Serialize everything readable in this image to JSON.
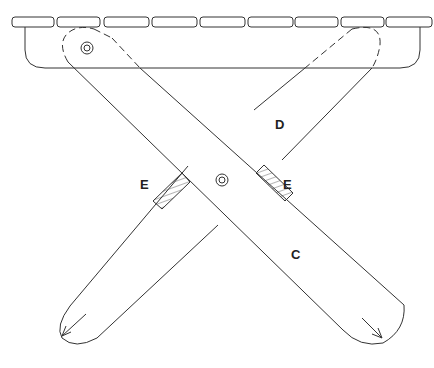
{
  "diagram": {
    "colors": {
      "line": "#333333",
      "background": "#ffffff",
      "hatch": "#444444"
    },
    "labels": {
      "leg_front": "C",
      "leg_back": "D",
      "block_left": "E",
      "block_right": "E"
    },
    "parts": [
      {
        "id": "seat-slats",
        "count": 9
      },
      {
        "id": "apron"
      },
      {
        "id": "leg-c",
        "label": "C"
      },
      {
        "id": "leg-d",
        "label": "D"
      },
      {
        "id": "pivot-bolt-top-left"
      },
      {
        "id": "pivot-bolt-center"
      },
      {
        "id": "stop-block-left",
        "label": "E"
      },
      {
        "id": "stop-block-right",
        "label": "E"
      }
    ]
  }
}
